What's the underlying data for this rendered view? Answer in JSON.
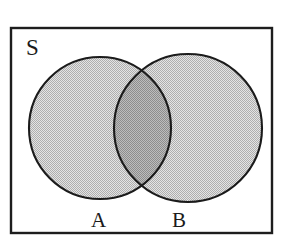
{
  "figure": {
    "type": "venn-diagram",
    "canvas": {
      "width": 289,
      "height": 243,
      "background": "#ffffff"
    }
  },
  "labels": {
    "universe": "S",
    "left_set": "A",
    "right_set": "B"
  },
  "colors": {
    "stroke": "#1b1b1b",
    "frame_stroke": "#1d1d1d",
    "circle_fill": "#c9c9c9",
    "intersection_fill": "#a6a6a6",
    "background": "#ffffff"
  },
  "geometry": {
    "frame": {
      "x": 11,
      "y": 28,
      "width": 261,
      "height": 205,
      "stroke_width": 2.4
    },
    "circle_a": {
      "cx": 100,
      "cy": 128,
      "r": 71
    },
    "circle_b": {
      "cx": 188,
      "cy": 128,
      "r": 74
    },
    "intersection_points": [
      {
        "x": 144,
        "y": 67
      },
      {
        "x": 144,
        "y": 190
      }
    ],
    "circle_stroke_width": 2.1
  },
  "regions": [
    {
      "name": "universe-outside-sets",
      "shading": "none",
      "fill": "#ffffff"
    },
    {
      "name": "set-a-only",
      "shading": "light-halftone",
      "fill": "#c9c9c9"
    },
    {
      "name": "set-b-only",
      "shading": "light-halftone",
      "fill": "#c9c9c9"
    },
    {
      "name": "a-intersect-b",
      "shading": "dark-halftone",
      "fill": "#a6a6a6"
    }
  ]
}
